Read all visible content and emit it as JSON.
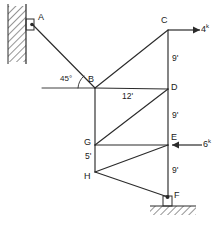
{
  "diagram": {
    "line_color": "#2b2b2b",
    "background": "#ffffff",
    "supports": {
      "wall": {
        "name": "vertical-hatched-wall",
        "label": ""
      },
      "ground": {
        "name": "hatched-ground",
        "label": ""
      }
    },
    "nodes": [
      {
        "id": "A",
        "label": "A",
        "x": 33,
        "y": 24
      },
      {
        "id": "B",
        "label": "B",
        "x": 95,
        "y": 88
      },
      {
        "id": "C",
        "label": "C",
        "x": 168,
        "y": 30
      },
      {
        "id": "D",
        "label": "D",
        "x": 168,
        "y": 89
      },
      {
        "id": "E",
        "label": "E",
        "x": 168,
        "y": 145
      },
      {
        "id": "F",
        "label": "F",
        "x": 168,
        "y": 197
      },
      {
        "id": "G",
        "label": "G",
        "x": 95,
        "y": 172
      },
      {
        "id": "H",
        "label": "H",
        "x": 95,
        "y": 145
      }
    ],
    "dimensions": [
      {
        "id": "cd",
        "label": "9'",
        "member": "C-D"
      },
      {
        "id": "bd",
        "label": "12'",
        "member": "B-D"
      },
      {
        "id": "de",
        "label": "9'",
        "member": "D-E"
      },
      {
        "id": "ef",
        "label": "9'",
        "member": "E-F"
      },
      {
        "id": "hg",
        "label": "5'",
        "member": "H-G"
      }
    ],
    "angles": [
      {
        "id": "b-angle",
        "label": "45°",
        "at_node": "B"
      }
    ],
    "loads": [
      {
        "id": "load-c",
        "label": "4",
        "unit": "k",
        "at_node": "C",
        "direction": "right"
      },
      {
        "id": "load-e",
        "label": "6",
        "unit": "k",
        "at_node": "E",
        "direction": "left"
      }
    ]
  }
}
